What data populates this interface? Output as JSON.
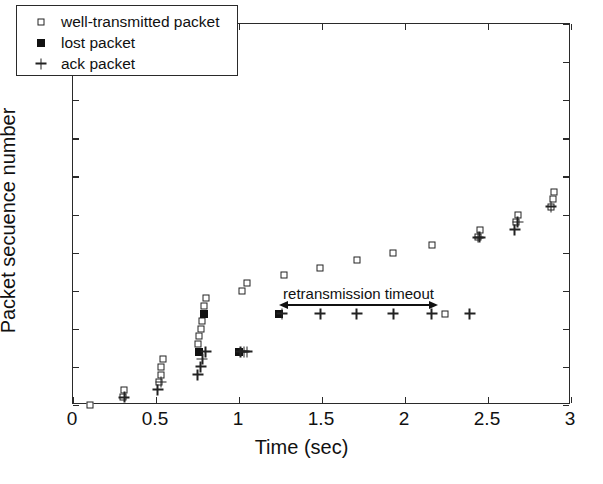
{
  "chart_data": {
    "type": "scatter",
    "title": "",
    "xlabel": "Time (sec)",
    "ylabel": "Packet secuence number",
    "xlim": [
      0,
      3
    ],
    "ylim": [
      0,
      50
    ],
    "xticks": [
      "0",
      "0.5",
      "1",
      "1.5",
      "2",
      "2.5",
      "3"
    ],
    "xtick_values": [
      0,
      0.5,
      1,
      1.5,
      2,
      2.5,
      3
    ],
    "yticks": [
      "0",
      "5",
      "10",
      "15",
      "20",
      "25",
      "30",
      "35",
      "40",
      "45",
      "50"
    ],
    "ytick_values": [
      0,
      5,
      10,
      15,
      20,
      25,
      30,
      35,
      40,
      45,
      50
    ],
    "grid": false,
    "legend_position": "upper-left",
    "series": [
      {
        "name": "well-transmitted packet",
        "marker": "open-square",
        "points": [
          [
            0.1,
            0
          ],
          [
            0.3,
            1
          ],
          [
            0.31,
            2
          ],
          [
            0.52,
            3
          ],
          [
            0.53,
            4
          ],
          [
            0.53,
            5
          ],
          [
            0.54,
            6
          ],
          [
            0.75,
            8
          ],
          [
            0.76,
            9
          ],
          [
            0.77,
            10
          ],
          [
            0.78,
            11
          ],
          [
            0.79,
            13
          ],
          [
            0.8,
            14
          ],
          [
            1.02,
            15
          ],
          [
            1.05,
            16
          ],
          [
            1.27,
            17
          ],
          [
            1.49,
            18
          ],
          [
            1.71,
            19
          ],
          [
            1.93,
            20
          ],
          [
            2.16,
            21
          ],
          [
            2.24,
            12
          ],
          [
            2.44,
            22
          ],
          [
            2.45,
            23
          ],
          [
            2.67,
            24
          ],
          [
            2.68,
            25
          ],
          [
            2.88,
            26
          ],
          [
            2.89,
            27
          ],
          [
            2.9,
            28
          ]
        ]
      },
      {
        "name": "lost packet",
        "marker": "filled-square",
        "points": [
          [
            0.76,
            7
          ],
          [
            0.79,
            12
          ],
          [
            1.0,
            7
          ],
          [
            1.24,
            12
          ]
        ]
      },
      {
        "name": "ack packet",
        "marker": "plus",
        "points": [
          [
            0.31,
            1
          ],
          [
            0.51,
            2
          ],
          [
            0.53,
            3
          ],
          [
            0.75,
            4
          ],
          [
            0.77,
            5
          ],
          [
            0.78,
            6
          ],
          [
            0.8,
            7
          ],
          [
            1.01,
            7
          ],
          [
            1.03,
            7
          ],
          [
            1.05,
            7
          ],
          [
            1.26,
            12
          ],
          [
            1.49,
            12
          ],
          [
            1.71,
            12
          ],
          [
            1.93,
            12
          ],
          [
            2.16,
            12
          ],
          [
            2.39,
            12
          ],
          [
            2.44,
            22
          ],
          [
            2.45,
            22
          ],
          [
            2.66,
            23
          ],
          [
            2.68,
            24
          ],
          [
            2.88,
            26
          ]
        ]
      }
    ],
    "annotations": [
      {
        "text": "retransmission timeout",
        "type": "double-arrow",
        "x_start": 1.24,
        "x_end": 2.2,
        "y": 13.2,
        "label_x": 1.72,
        "label_y": 14.6
      }
    ]
  },
  "legend": {
    "items": [
      {
        "label": "well-transmitted packet",
        "symbol": "open-square-icon"
      },
      {
        "label": "lost packet",
        "symbol": "filled-square-icon"
      },
      {
        "label": "ack packet",
        "symbol": "plus-icon"
      }
    ]
  }
}
